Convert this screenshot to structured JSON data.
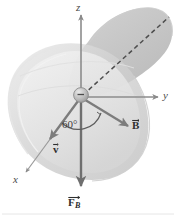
{
  "figure": {
    "kind": "physics-vector-diagram",
    "width": 176,
    "height": 219,
    "background_color": "#ffffff"
  },
  "axes": {
    "z": {
      "label": "z",
      "direction": "up",
      "tip": [
        81,
        14
      ],
      "origin": [
        81,
        97
      ]
    },
    "y": {
      "label": "y",
      "direction": "right",
      "tip": [
        160,
        97
      ],
      "origin": [
        81,
        97
      ]
    },
    "x": {
      "label": "x",
      "direction": "down-left",
      "tip": [
        22,
        176
      ],
      "origin": [
        81,
        97
      ]
    }
  },
  "vectors": [
    {
      "name": "velocity",
      "label": "v",
      "subscript": "",
      "has_overbar_arrow": true,
      "direction": "down-left along x-axis",
      "tip": [
        46,
        150
      ],
      "origin": [
        81,
        97
      ]
    },
    {
      "name": "magnetic-field",
      "label": "B",
      "subscript": "",
      "has_overbar_arrow": true,
      "direction": "down-right",
      "tip": [
        132,
        130
      ],
      "origin": [
        81,
        97
      ]
    },
    {
      "name": "magnetic-force",
      "label": "F",
      "subscript": "B",
      "has_overbar_arrow": true,
      "direction": "down along negative z-axis",
      "tip": [
        81,
        192
      ],
      "origin": [
        81,
        97
      ]
    }
  ],
  "angle": {
    "label": "60°",
    "value": 60,
    "unit": "degrees",
    "between": [
      "v",
      "B"
    ]
  },
  "dashed_line": {
    "name": "normal-reference-line",
    "style": "dashed",
    "from": [
      81,
      97
    ],
    "to": [
      168,
      18
    ]
  },
  "particle": {
    "name": "charged-particle",
    "shape": "sphere",
    "center": [
      81,
      97
    ],
    "radius": 7,
    "sign_marker": "–"
  },
  "shaded_region": {
    "name": "plane-blob",
    "fill_color": "#c9c9c9",
    "outline_color": "#d8d8d8",
    "description": "gray curved sheet / plane surface behind the axes"
  },
  "colors": {
    "axis_line": "#8a8a8a",
    "vector_line": "#7f7f7f",
    "dashed_line": "#595959",
    "label_text": "#3a3a3a",
    "blob_dark": "#bdbdbd",
    "blob_mid": "#d4d4d4",
    "blob_light": "#ececec",
    "baseline_rule": "#e2e2e2"
  }
}
